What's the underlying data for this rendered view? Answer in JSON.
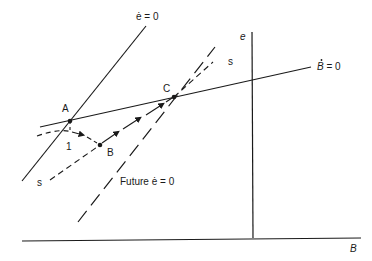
{
  "diagram": {
    "axes": {
      "x_label": "B",
      "y_label": "e"
    },
    "curves": {
      "e_dot_zero": "ė = 0",
      "b_dot_zero_prefix": "B",
      "b_dot_zero_suffix": " = 0",
      "future_e_dot_zero": "Future ė = 0",
      "saddle_path_start": "s",
      "saddle_path_end": "s"
    },
    "points": {
      "a": "A",
      "b": "B",
      "c": "C",
      "step_label": "1"
    },
    "colors": {
      "line": "#1a1a1a",
      "background": "#ffffff"
    }
  }
}
